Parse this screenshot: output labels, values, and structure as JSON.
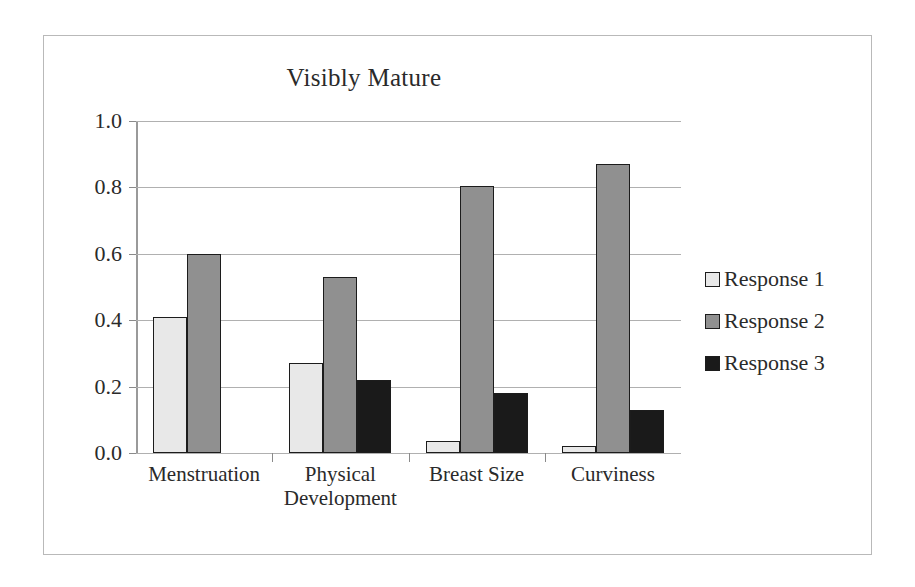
{
  "chart_data": {
    "type": "bar",
    "title": "Visibly Mature",
    "xlabel": "",
    "ylabel": "",
    "ylim": [
      0.0,
      1.0
    ],
    "ytick_labels": [
      "0.0",
      "0.2",
      "0.4",
      "0.6",
      "0.8",
      "1.0"
    ],
    "ytick_values": [
      0.0,
      0.2,
      0.4,
      0.6,
      0.8,
      1.0
    ],
    "grid": true,
    "legend_position": "right",
    "categories": [
      "Menstruation",
      "Physical Development",
      "Breast Size",
      "Curviness"
    ],
    "category_lines": [
      [
        "Menstruation"
      ],
      [
        "Physical",
        "Development"
      ],
      [
        "Breast Size"
      ],
      [
        "Curviness"
      ]
    ],
    "series": [
      {
        "name": "Response 1",
        "color": "#e8e8e8",
        "values": [
          0.41,
          0.27,
          0.035,
          0.02
        ]
      },
      {
        "name": "Response 2",
        "color": "#909090",
        "values": [
          0.6,
          0.53,
          0.805,
          0.87
        ]
      },
      {
        "name": "Response 3",
        "color": "#1a1a1a",
        "values": [
          0.0,
          0.22,
          0.18,
          0.13
        ]
      }
    ]
  },
  "frame": {
    "border_color": "#b9b9b9"
  }
}
